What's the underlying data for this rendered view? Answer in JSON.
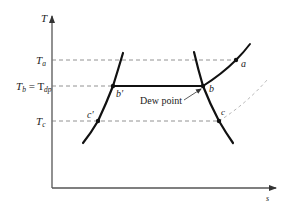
{
  "diagram": {
    "type": "T-s diagram",
    "axes": {
      "y_label": "T",
      "x_label": "s"
    },
    "levels": [
      {
        "id": "Ta",
        "label_main": "T",
        "label_sub": "a"
      },
      {
        "id": "Tb",
        "label_main": "T",
        "label_sub": "b",
        "label_eq": " = T",
        "label_eq_sub": "dp"
      },
      {
        "id": "Tc",
        "label_main": "T",
        "label_sub": "c"
      }
    ],
    "points": {
      "a": "a",
      "b": "b",
      "b_prime": "b′",
      "c": "c",
      "c_prime": "c′"
    },
    "annotation": {
      "dew_point": "Dew point"
    },
    "colors": {
      "curve": "#111111",
      "axis": "#555555",
      "dashed": "#777777",
      "light_dashed": "#aaaaaa"
    }
  }
}
